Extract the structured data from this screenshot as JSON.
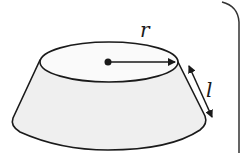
{
  "diagram": {
    "shape": "frustum",
    "labels": {
      "radius": "r",
      "slant_height": "l"
    },
    "colors": {
      "stroke": "#1a1a1a",
      "side_fill": "#efefef",
      "top_fill": "#fafafa",
      "background": "#ffffff"
    }
  }
}
